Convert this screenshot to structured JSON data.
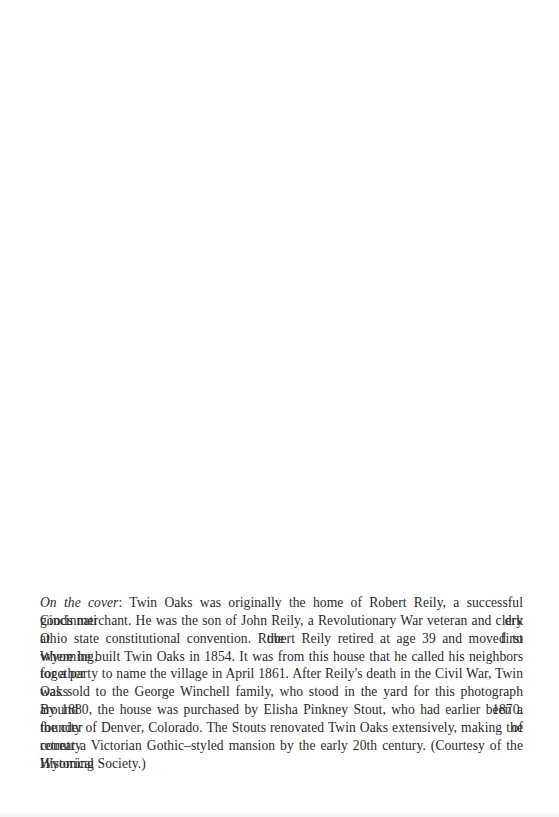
{
  "page": {
    "background": "#ffffff",
    "text_color": "#2a2a2a"
  },
  "caption": {
    "lead_italic": "On the cover",
    "lead_separator": ":",
    "full_text": "On the cover: Twin Oaks was originally the home of Robert Reily, a successful Cincinnati dry goods merchant. He was the son of John Reily, a Revolutionary War veteran and clerk at the first Ohio state constitutional convention. Robert Reily retired at age 39 and moved to Wyoming, where he built Twin Oaks in 1854. It was from this house that he called his neighbors together for a party to name the village in April 1861. After Reily's death in the Civil War, Twin Oaks was sold to the George Winchell family, who stood in the yard for this photograph around 1870. By 1880, the house was purchased by Elisha Pinkney Stout, who had earlier been a founder of the city of Denver, Colorado. The Stouts renovated Twin Oaks extensively, making the country retreat a Victorian Gothic–styled mansion by the early 20th century. (Courtesy of the Wyoming Historical Society.)",
    "lines": [
      " Twin Oaks was originally the home of Robert Reily, a successful Cincinnati dry",
      "goods merchant. He was the son of John Reily, a Revolutionary War veteran and clerk at the first",
      "Ohio state constitutional convention. Robert Reily retired at age 39 and moved to Wyoming,",
      "where he built Twin Oaks in 1854. It was from this house that he called his neighbors together",
      "for a party to name the village in April 1861. After Reily's death in the Civil War, Twin Oaks",
      "was sold to the George Winchell family, who stood in the yard for this photograph around 1870.",
      "By 1880, the house was purchased by Elisha Pinkney Stout, who had earlier been a founder of",
      "the city of Denver, Colorado. The Stouts renovated Twin Oaks extensively, making the country",
      "retreat a Victorian Gothic–styled mansion by the early 20th century. (Courtesy of the Wyoming",
      "Historical Society.)"
    ]
  }
}
